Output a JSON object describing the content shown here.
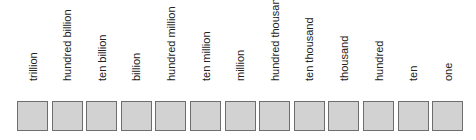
{
  "diagram": {
    "places": [
      {
        "label": "trillion"
      },
      {
        "label": "hundred billion"
      },
      {
        "label": "ten billion"
      },
      {
        "label": "billion"
      },
      {
        "label": "hundred million"
      },
      {
        "label": "ten million"
      },
      {
        "label": "million"
      },
      {
        "label": "hundred thousand"
      },
      {
        "label": "ten thousand"
      },
      {
        "label": "thousand"
      },
      {
        "label": "hundred"
      },
      {
        "label": "ten"
      },
      {
        "label": "one"
      }
    ],
    "colors": {
      "box_fill": "#d2d2d2",
      "box_border": "#6e6e6e",
      "label_text": "#222222"
    }
  }
}
